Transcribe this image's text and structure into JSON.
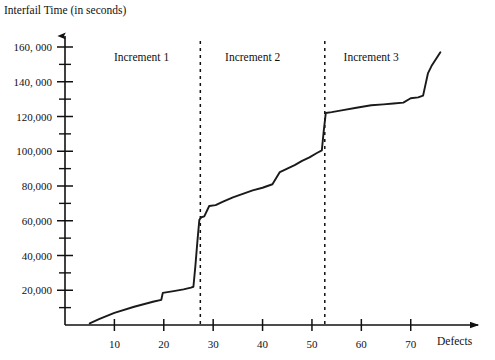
{
  "chart_data": {
    "type": "line",
    "title": "Interfail Time (in seconds)",
    "xlabel": "Defects",
    "ylabel": "Interfail Time (in seconds)",
    "xlim": [
      0,
      82
    ],
    "ylim": [
      0,
      168000
    ],
    "grid": false,
    "legend": "none",
    "x_ticks": [
      10,
      20,
      30,
      40,
      50,
      60,
      70
    ],
    "x_tick_labels": [
      "10",
      "20",
      "30",
      "40",
      "50",
      "60",
      "70"
    ],
    "y_ticks": [
      20000,
      40000,
      60000,
      80000,
      100000,
      120000,
      140000,
      160000
    ],
    "y_tick_labels": [
      "20,000",
      "40,000",
      "60,000",
      "80,000",
      "100,000",
      "120,000",
      "140, 000",
      "160, 000"
    ],
    "y_minor_ticks": [
      10000,
      30000,
      50000,
      70000,
      90000,
      110000,
      130000,
      150000
    ],
    "series": [
      {
        "name": "Interfail time",
        "x": [
          5,
          7,
          10,
          14,
          18,
          19.5,
          19.8,
          22,
          24,
          25.5,
          26,
          26.4,
          26.8,
          27.2,
          27.6,
          28.2,
          29.2,
          30.5,
          32,
          34,
          36,
          38,
          40,
          42,
          43.5,
          45,
          46.5,
          48,
          49.5,
          51,
          52,
          52.4,
          52.8,
          54,
          56,
          59,
          62,
          64.5,
          66.5,
          68.5,
          70,
          71.5,
          72.5,
          73.5,
          74.2,
          76
        ],
        "y": [
          1000,
          3500,
          7000,
          10500,
          13500,
          14500,
          18500,
          19500,
          20500,
          21500,
          22000,
          34000,
          48000,
          60500,
          62000,
          62500,
          68500,
          69000,
          71000,
          73500,
          75500,
          77500,
          79000,
          81000,
          88000,
          90000,
          92000,
          94500,
          96500,
          99000,
          100500,
          112000,
          122000,
          122500,
          123500,
          125000,
          126500,
          127000,
          127500,
          128000,
          130500,
          131000,
          132000,
          145000,
          149000,
          157000
        ]
      }
    ],
    "annotations": [
      {
        "label": "Increment 1",
        "x_center": 15.5,
        "y": 152000
      },
      {
        "label": "Increment 2",
        "x_center": 38.0,
        "y": 152000
      },
      {
        "label": "Increment 3",
        "x_center": 62.0,
        "y": 152000
      }
    ],
    "dividers": [
      {
        "x": 27.4,
        "style": "dashed"
      },
      {
        "x": 52.6,
        "style": "dashed"
      }
    ]
  }
}
